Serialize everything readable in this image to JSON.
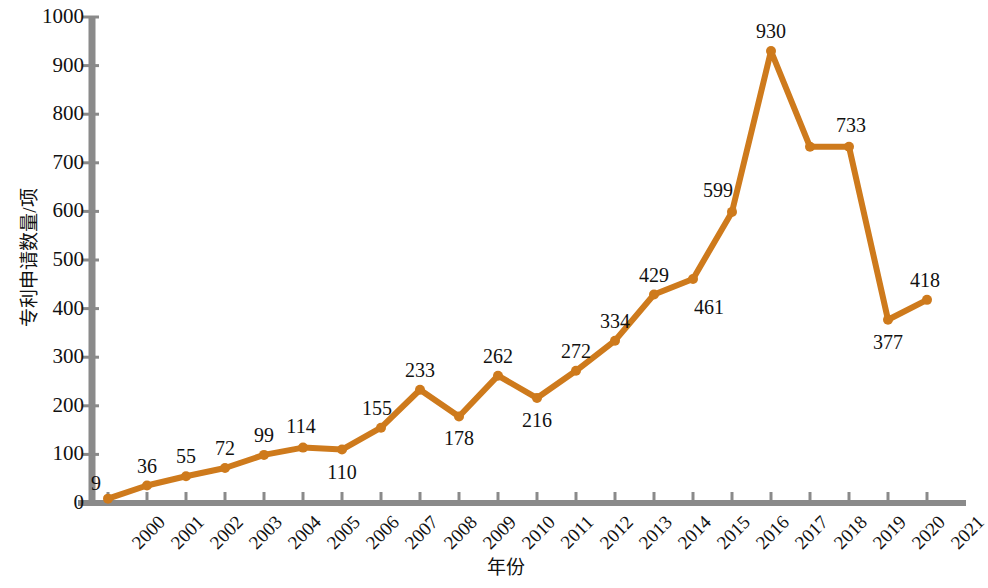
{
  "chart_data": {
    "type": "line",
    "title": "",
    "xlabel": "年份",
    "ylabel": "专利申请数量/项",
    "categories": [
      "2000",
      "2001",
      "2002",
      "2003",
      "2004",
      "2005",
      "2006",
      "2007",
      "2008",
      "2009",
      "2010",
      "2011",
      "2012",
      "2013",
      "2014",
      "2015",
      "2016",
      "2017",
      "2018",
      "2019",
      "2020",
      "2021"
    ],
    "values": [
      9,
      36,
      55,
      72,
      99,
      114,
      110,
      155,
      233,
      178,
      262,
      216,
      272,
      334,
      429,
      461,
      599,
      930,
      733,
      733,
      377,
      418
    ],
    "point_labels": [
      "9",
      "36",
      "55",
      "72",
      "99",
      "114",
      "110",
      "155",
      "233",
      "178",
      "262",
      "216",
      "272",
      "334",
      "429",
      "461",
      "599",
      "930",
      "",
      "733",
      "377",
      "418"
    ],
    "label_positions": [
      "above",
      "above",
      "above",
      "above",
      "above",
      "above",
      "below",
      "above",
      "above",
      "below",
      "above",
      "below",
      "above",
      "above",
      "above",
      "below",
      "above",
      "above",
      "",
      "above",
      "below",
      "above"
    ],
    "ylim": [
      0,
      1000
    ],
    "yticks": [
      0,
      100,
      200,
      300,
      400,
      500,
      600,
      700,
      800,
      900,
      1000
    ],
    "ytick_labels": [
      "0",
      "100",
      "200",
      "300",
      "400",
      "500",
      "600",
      "700",
      "800",
      "900",
      "1000"
    ],
    "grid": false,
    "legend": "none",
    "series_color": "#CE7A1C",
    "axis_color": "#8A8A8A",
    "marker": "circle",
    "line_width": 6
  },
  "axes": {
    "y_axis_label": "专利申请数量/项",
    "x_axis_label": "年份"
  }
}
